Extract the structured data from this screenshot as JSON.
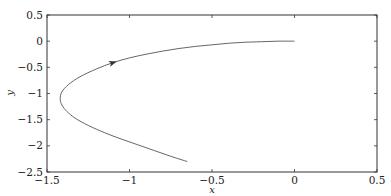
{
  "chart_data": {
    "type": "line",
    "title": "",
    "xlabel": "x",
    "ylabel": "y",
    "xlim": [
      -1.5,
      0.5
    ],
    "ylim": [
      -2.5,
      0.5
    ],
    "xticks": [
      -1.5,
      -1,
      -0.5,
      0,
      0.5
    ],
    "yticks": [
      0.5,
      0,
      -0.5,
      -1,
      -1.5,
      -2,
      -2.5
    ],
    "xtick_labels": [
      "−1.5",
      "−1",
      "−0.5",
      "0",
      "0.5"
    ],
    "ytick_labels": [
      "0.5",
      "0",
      "−0.5",
      "−1",
      "−1.5",
      "−2",
      "−2.5"
    ],
    "grid": false,
    "legend": null,
    "series": [
      {
        "name": "trajectory",
        "color": "#555555",
        "x": [
          0.0,
          -0.1,
          -0.2,
          -0.3,
          -0.4,
          -0.5,
          -0.6,
          -0.7,
          -0.8,
          -0.9,
          -1.0,
          -1.1,
          -1.2,
          -1.3,
          -1.37,
          -1.41,
          -1.42,
          -1.41,
          -1.38,
          -1.33,
          -1.25,
          -1.15,
          -1.05,
          -0.95,
          -0.85,
          -0.75,
          -0.65
        ],
        "y": [
          0.0,
          0.0,
          -0.01,
          -0.02,
          -0.04,
          -0.07,
          -0.1,
          -0.14,
          -0.19,
          -0.25,
          -0.32,
          -0.41,
          -0.53,
          -0.68,
          -0.83,
          -0.97,
          -1.1,
          -1.22,
          -1.34,
          -1.47,
          -1.61,
          -1.75,
          -1.87,
          -1.98,
          -2.09,
          -2.2,
          -2.3
        ]
      }
    ],
    "annotations": [
      {
        "type": "direction-arrow",
        "x": -1.1,
        "y": -0.41,
        "direction": "right-up"
      }
    ]
  }
}
